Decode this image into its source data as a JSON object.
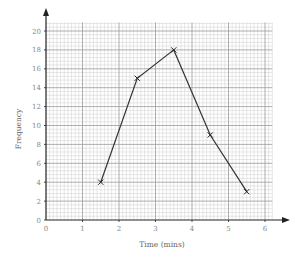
{
  "chart_data": {
    "type": "line",
    "title": "",
    "xlabel": "Time (mins)",
    "ylabel": "Frequency",
    "xlim": [
      0,
      6.2
    ],
    "ylim": [
      0,
      20.9
    ],
    "x_ticks": [
      0,
      1,
      2,
      3,
      4,
      5,
      6
    ],
    "y_ticks": [
      0,
      2,
      4,
      6,
      8,
      10,
      12,
      14,
      16,
      18,
      20
    ],
    "grid": true,
    "marker": "x",
    "series": [
      {
        "name": "Frequency polygon",
        "x": [
          1.5,
          2.5,
          3.5,
          4.5,
          5.5
        ],
        "y": [
          4,
          15,
          18,
          9,
          3
        ]
      }
    ],
    "colors": {
      "line": "#333333",
      "major_grid": "#9a9a9a",
      "minor_grid": "#cfcfcf",
      "axis": "#222222",
      "tick_label": "#888888"
    }
  }
}
